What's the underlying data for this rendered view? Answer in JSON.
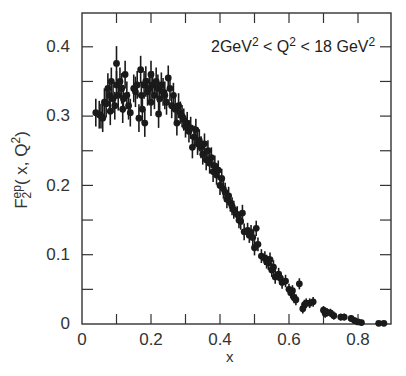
{
  "chart_data": {
    "type": "scatter",
    "title": "",
    "annotation": "2 GeV^2 < Q^2 < 18 GeV^2",
    "annotation_parts": {
      "a": "2GeV",
      "b": "2",
      "c": " < Q",
      "d": "2",
      "e": " < 18 GeV",
      "f": "2"
    },
    "xlabel": "x",
    "ylabel": "F2^ep(x, Q^2)",
    "ylabel_parts": {
      "f": "F",
      "sup": "ep",
      "sub": "2",
      "rest": "( x, Q",
      "sq": "2",
      ")": ")"
    },
    "xlim": [
      0,
      0.9
    ],
    "ylim": [
      0,
      0.44
    ],
    "xticks": [
      "0",
      "0.2",
      "0.4",
      "0.6",
      "0.8"
    ],
    "xtick_values": [
      0,
      0.2,
      0.4,
      0.6,
      0.8
    ],
    "xminor_ticks": [
      0.1,
      0.3,
      0.5,
      0.7
    ],
    "yticks": [
      "0",
      "0.1",
      "0.2",
      "0.3",
      "0.4"
    ],
    "ytick_values": [
      0,
      0.1,
      0.2,
      0.3,
      0.4
    ],
    "yminor_ticks": [
      0.05,
      0.15,
      0.25,
      0.35
    ],
    "grid": false,
    "legend": null,
    "series": [
      {
        "name": "F2 ep data",
        "marker": "filled-circle",
        "color": "#1a1a1a",
        "points": [
          {
            "x": 0.04,
            "y": 0.305,
            "e": 0.02
          },
          {
            "x": 0.05,
            "y": 0.302,
            "e": 0.02
          },
          {
            "x": 0.055,
            "y": 0.3,
            "e": 0.018
          },
          {
            "x": 0.06,
            "y": 0.297,
            "e": 0.02
          },
          {
            "x": 0.065,
            "y": 0.32,
            "e": 0.02
          },
          {
            "x": 0.07,
            "y": 0.318,
            "e": 0.02
          },
          {
            "x": 0.075,
            "y": 0.34,
            "e": 0.022
          },
          {
            "x": 0.08,
            "y": 0.33,
            "e": 0.02
          },
          {
            "x": 0.082,
            "y": 0.307,
            "e": 0.02
          },
          {
            "x": 0.085,
            "y": 0.35,
            "e": 0.02
          },
          {
            "x": 0.09,
            "y": 0.325,
            "e": 0.02
          },
          {
            "x": 0.095,
            "y": 0.315,
            "e": 0.02
          },
          {
            "x": 0.1,
            "y": 0.376,
            "e": 0.025
          },
          {
            "x": 0.1,
            "y": 0.345,
            "e": 0.02
          },
          {
            "x": 0.105,
            "y": 0.33,
            "e": 0.022
          },
          {
            "x": 0.11,
            "y": 0.35,
            "e": 0.02
          },
          {
            "x": 0.115,
            "y": 0.34,
            "e": 0.022
          },
          {
            "x": 0.118,
            "y": 0.31,
            "e": 0.02
          },
          {
            "x": 0.12,
            "y": 0.325,
            "e": 0.02
          },
          {
            "x": 0.125,
            "y": 0.36,
            "e": 0.02
          },
          {
            "x": 0.13,
            "y": 0.33,
            "e": 0.02
          },
          {
            "x": 0.135,
            "y": 0.315,
            "e": 0.02
          },
          {
            "x": 0.14,
            "y": 0.305,
            "e": 0.02
          },
          {
            "x": 0.15,
            "y": 0.34,
            "e": 0.02
          },
          {
            "x": 0.155,
            "y": 0.335,
            "e": 0.022
          },
          {
            "x": 0.16,
            "y": 0.345,
            "e": 0.02
          },
          {
            "x": 0.165,
            "y": 0.297,
            "e": 0.02
          },
          {
            "x": 0.17,
            "y": 0.367,
            "e": 0.02
          },
          {
            "x": 0.172,
            "y": 0.33,
            "e": 0.02
          },
          {
            "x": 0.175,
            "y": 0.31,
            "e": 0.02
          },
          {
            "x": 0.18,
            "y": 0.345,
            "e": 0.02
          },
          {
            "x": 0.182,
            "y": 0.29,
            "e": 0.02
          },
          {
            "x": 0.185,
            "y": 0.35,
            "e": 0.022
          },
          {
            "x": 0.19,
            "y": 0.335,
            "e": 0.02
          },
          {
            "x": 0.195,
            "y": 0.34,
            "e": 0.02
          },
          {
            "x": 0.2,
            "y": 0.36,
            "e": 0.02
          },
          {
            "x": 0.2,
            "y": 0.32,
            "e": 0.02
          },
          {
            "x": 0.205,
            "y": 0.345,
            "e": 0.02
          },
          {
            "x": 0.21,
            "y": 0.33,
            "e": 0.02
          },
          {
            "x": 0.215,
            "y": 0.35,
            "e": 0.02
          },
          {
            "x": 0.22,
            "y": 0.34,
            "e": 0.02
          },
          {
            "x": 0.222,
            "y": 0.303,
            "e": 0.02
          },
          {
            "x": 0.225,
            "y": 0.325,
            "e": 0.02
          },
          {
            "x": 0.23,
            "y": 0.345,
            "e": 0.018
          },
          {
            "x": 0.235,
            "y": 0.335,
            "e": 0.02
          },
          {
            "x": 0.24,
            "y": 0.33,
            "e": 0.02
          },
          {
            "x": 0.245,
            "y": 0.32,
            "e": 0.018
          },
          {
            "x": 0.25,
            "y": 0.355,
            "e": 0.018
          },
          {
            "x": 0.255,
            "y": 0.34,
            "e": 0.018
          },
          {
            "x": 0.26,
            "y": 0.315,
            "e": 0.018
          },
          {
            "x": 0.265,
            "y": 0.33,
            "e": 0.018
          },
          {
            "x": 0.27,
            "y": 0.31,
            "e": 0.018
          },
          {
            "x": 0.275,
            "y": 0.29,
            "e": 0.018
          },
          {
            "x": 0.28,
            "y": 0.315,
            "e": 0.018
          },
          {
            "x": 0.285,
            "y": 0.305,
            "e": 0.016
          },
          {
            "x": 0.29,
            "y": 0.3,
            "e": 0.016
          },
          {
            "x": 0.295,
            "y": 0.295,
            "e": 0.016
          },
          {
            "x": 0.3,
            "y": 0.285,
            "e": 0.016
          },
          {
            "x": 0.305,
            "y": 0.29,
            "e": 0.016
          },
          {
            "x": 0.31,
            "y": 0.278,
            "e": 0.016
          },
          {
            "x": 0.315,
            "y": 0.283,
            "e": 0.016
          },
          {
            "x": 0.32,
            "y": 0.255,
            "e": 0.016
          },
          {
            "x": 0.325,
            "y": 0.27,
            "e": 0.016
          },
          {
            "x": 0.33,
            "y": 0.28,
            "e": 0.016
          },
          {
            "x": 0.335,
            "y": 0.26,
            "e": 0.016
          },
          {
            "x": 0.34,
            "y": 0.265,
            "e": 0.016
          },
          {
            "x": 0.345,
            "y": 0.255,
            "e": 0.016
          },
          {
            "x": 0.35,
            "y": 0.245,
            "e": 0.015
          },
          {
            "x": 0.355,
            "y": 0.26,
            "e": 0.015
          },
          {
            "x": 0.36,
            "y": 0.237,
            "e": 0.015
          },
          {
            "x": 0.365,
            "y": 0.25,
            "e": 0.015
          },
          {
            "x": 0.37,
            "y": 0.232,
            "e": 0.015
          },
          {
            "x": 0.375,
            "y": 0.24,
            "e": 0.015
          },
          {
            "x": 0.38,
            "y": 0.22,
            "e": 0.015
          },
          {
            "x": 0.385,
            "y": 0.228,
            "e": 0.015
          },
          {
            "x": 0.39,
            "y": 0.215,
            "e": 0.014
          },
          {
            "x": 0.395,
            "y": 0.222,
            "e": 0.014
          },
          {
            "x": 0.4,
            "y": 0.2,
            "e": 0.014
          },
          {
            "x": 0.405,
            "y": 0.21,
            "e": 0.014
          },
          {
            "x": 0.41,
            "y": 0.195,
            "e": 0.014
          },
          {
            "x": 0.415,
            "y": 0.19,
            "e": 0.014
          },
          {
            "x": 0.42,
            "y": 0.18,
            "e": 0.013
          },
          {
            "x": 0.425,
            "y": 0.185,
            "e": 0.013
          },
          {
            "x": 0.43,
            "y": 0.175,
            "e": 0.013
          },
          {
            "x": 0.435,
            "y": 0.17,
            "e": 0.013
          },
          {
            "x": 0.44,
            "y": 0.165,
            "e": 0.013
          },
          {
            "x": 0.45,
            "y": 0.158,
            "e": 0.012
          },
          {
            "x": 0.455,
            "y": 0.15,
            "e": 0.012
          },
          {
            "x": 0.46,
            "y": 0.148,
            "e": 0.012
          },
          {
            "x": 0.465,
            "y": 0.16,
            "e": 0.012
          },
          {
            "x": 0.47,
            "y": 0.133,
            "e": 0.012
          },
          {
            "x": 0.48,
            "y": 0.135,
            "e": 0.011
          },
          {
            "x": 0.485,
            "y": 0.128,
            "e": 0.011
          },
          {
            "x": 0.49,
            "y": 0.132,
            "e": 0.011
          },
          {
            "x": 0.495,
            "y": 0.125,
            "e": 0.011
          },
          {
            "x": 0.5,
            "y": 0.11,
            "e": 0.011
          },
          {
            "x": 0.505,
            "y": 0.138,
            "e": 0.011
          },
          {
            "x": 0.51,
            "y": 0.115,
            "e": 0.01
          },
          {
            "x": 0.52,
            "y": 0.098,
            "e": 0.01
          },
          {
            "x": 0.53,
            "y": 0.095,
            "e": 0.01
          },
          {
            "x": 0.535,
            "y": 0.09,
            "e": 0.01
          },
          {
            "x": 0.54,
            "y": 0.088,
            "e": 0.01
          },
          {
            "x": 0.545,
            "y": 0.093,
            "e": 0.01
          },
          {
            "x": 0.55,
            "y": 0.078,
            "e": 0.01
          },
          {
            "x": 0.555,
            "y": 0.082,
            "e": 0.01
          },
          {
            "x": 0.56,
            "y": 0.068,
            "e": 0.01
          },
          {
            "x": 0.57,
            "y": 0.072,
            "e": 0.009
          },
          {
            "x": 0.575,
            "y": 0.066,
            "e": 0.009
          },
          {
            "x": 0.58,
            "y": 0.06,
            "e": 0.009
          },
          {
            "x": 0.59,
            "y": 0.062,
            "e": 0.009
          },
          {
            "x": 0.6,
            "y": 0.05,
            "e": 0.008
          },
          {
            "x": 0.605,
            "y": 0.045,
            "e": 0.008
          },
          {
            "x": 0.61,
            "y": 0.048,
            "e": 0.008
          },
          {
            "x": 0.615,
            "y": 0.038,
            "e": 0.008
          },
          {
            "x": 0.62,
            "y": 0.035,
            "e": 0.008
          },
          {
            "x": 0.63,
            "y": 0.058,
            "e": 0.008
          },
          {
            "x": 0.64,
            "y": 0.022,
            "e": 0.007
          },
          {
            "x": 0.645,
            "y": 0.028,
            "e": 0.007
          },
          {
            "x": 0.65,
            "y": 0.03,
            "e": 0.007
          },
          {
            "x": 0.66,
            "y": 0.03,
            "e": 0.007
          },
          {
            "x": 0.67,
            "y": 0.032,
            "e": 0.007
          },
          {
            "x": 0.7,
            "y": 0.02,
            "e": 0.006
          },
          {
            "x": 0.705,
            "y": 0.015,
            "e": 0.006
          },
          {
            "x": 0.71,
            "y": 0.017,
            "e": 0.006
          },
          {
            "x": 0.72,
            "y": 0.016,
            "e": 0.006
          },
          {
            "x": 0.73,
            "y": 0.012,
            "e": 0.006
          },
          {
            "x": 0.75,
            "y": 0.01,
            "e": 0.005
          },
          {
            "x": 0.76,
            "y": 0.01,
            "e": 0.005
          },
          {
            "x": 0.78,
            "y": 0.008,
            "e": 0.005
          },
          {
            "x": 0.79,
            "y": 0.005,
            "e": 0.005
          },
          {
            "x": 0.8,
            "y": 0.003,
            "e": 0.004
          },
          {
            "x": 0.81,
            "y": 0.002,
            "e": 0.004
          },
          {
            "x": 0.86,
            "y": 0.001,
            "e": 0.003
          },
          {
            "x": 0.875,
            "y": 0.001,
            "e": 0.003
          }
        ]
      }
    ]
  }
}
